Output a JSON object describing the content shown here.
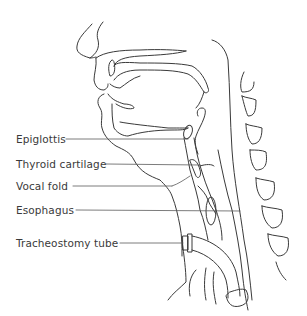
{
  "diagram": {
    "line_color": "#3a3a3a",
    "background": "#ffffff",
    "labels": [
      {
        "text": "Epiglottis",
        "x": 16,
        "y": 135,
        "line_to": [
          188,
          139
        ]
      },
      {
        "text": "Thyroid cartilage",
        "x": 16,
        "y": 160,
        "line_to": [
          200,
          165
        ]
      },
      {
        "text": "Vocal fold",
        "x": 16,
        "y": 182,
        "line_to": [
          174,
          186
        ]
      },
      {
        "text": "Esophagus",
        "x": 16,
        "y": 206,
        "line_to": [
          240,
          211
        ]
      },
      {
        "text": "Tracheostomy tube",
        "x": 16,
        "y": 239,
        "line_to": [
          185,
          243
        ]
      }
    ]
  }
}
